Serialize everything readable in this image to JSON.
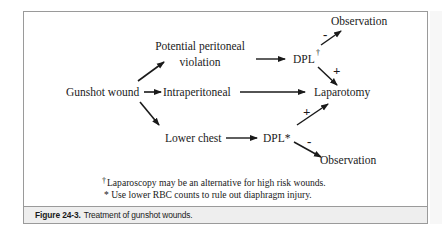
{
  "nodes": {
    "gunshot_wound": "Gunshot wound",
    "potential_line1": "Potential peritoneal",
    "potential_line2": "violation",
    "intraperitoneal": "Intraperitoneal",
    "lower_chest": "Lower chest",
    "dpl_top": "DPL",
    "dpl_top_mark": "†",
    "dpl_bottom": "DPL*",
    "laparotomy": "Laparotomy",
    "observation_top": "Observation",
    "observation_bottom": "Observation"
  },
  "edges": {
    "dpl_top_to_observation": "-",
    "dpl_top_to_laparotomy": "+",
    "dpl_bottom_to_laparotomy": "+",
    "dpl_bottom_to_observation": "-"
  },
  "footnotes": {
    "dagger_mark": "†",
    "dagger_text": "Laparoscopy may be an alternative for high risk wounds.",
    "asterisk_text": "* Use lower RBC counts to rule out diaphragm injury."
  },
  "caption": {
    "label": "Figure 24-3.",
    "text": "Treatment of gunshot wounds."
  },
  "colors": {
    "border": "#9a9a9a",
    "caption_bg": "#eeeeee",
    "ink": "#1a1a1a"
  }
}
